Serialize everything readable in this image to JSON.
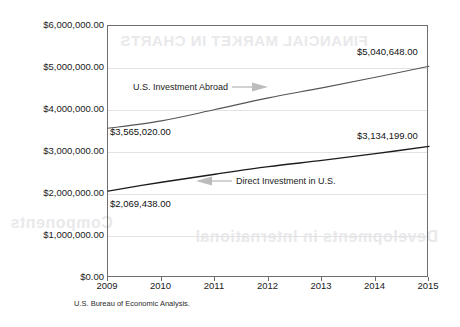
{
  "chart_data": {
    "type": "line",
    "title": "",
    "xlabel": "",
    "ylabel": "",
    "x": [
      2009,
      2010,
      2011,
      2012,
      2013,
      2014,
      2015
    ],
    "categories": [
      "2009",
      "2010",
      "2011",
      "2012",
      "2013",
      "2014",
      "2015"
    ],
    "xlim": [
      2009,
      2015
    ],
    "ylim": [
      0,
      6000000
    ],
    "grid": true,
    "legend_position": "inline-annotations",
    "ytick_labels": [
      "$0.00",
      "$1,000,000.00",
      "$2,000,000.00",
      "$3,000,000.00",
      "$4,000,000.00",
      "$5,000,000.00",
      "$6,000,000.00"
    ],
    "ytick_values": [
      0,
      1000000,
      2000000,
      3000000,
      4000000,
      5000000,
      6000000
    ],
    "series": [
      {
        "name": "U.S. Investment Abroad",
        "values": [
          3565020,
          3741000,
          4010000,
          4289000,
          4527000,
          4780000,
          5040648
        ],
        "color": "#555555",
        "start_label": "$3,565,020.00",
        "end_label": "$5,040,648.00"
      },
      {
        "name": "Direct Investment in U.S.",
        "values": [
          2069438,
          2280000,
          2470000,
          2650000,
          2800000,
          2960000,
          3134199
        ],
        "color": "#1c1c1c",
        "start_label": "$2,069,438.00",
        "end_label": "$3,134,199.00"
      }
    ],
    "annotations": [
      {
        "text": "U.S. Investment Abroad",
        "arrow": "right"
      },
      {
        "text": "Direct Investment in U.S.",
        "arrow": "left"
      }
    ],
    "source": "U.S. Bureau of Economic Analysis."
  },
  "bleed_through": {
    "top": "FINANCIAL MARKET IN CHARTS",
    "middle": "Components",
    "low": "Developments in International"
  }
}
